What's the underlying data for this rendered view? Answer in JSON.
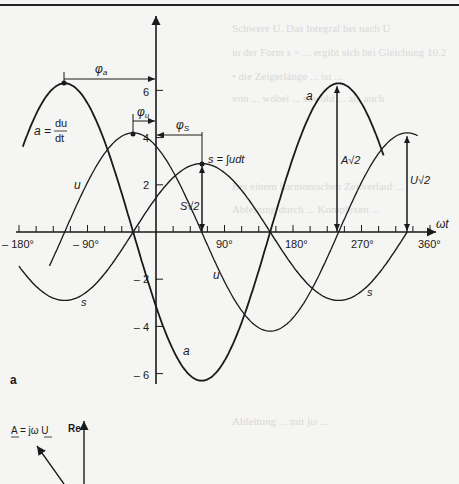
{
  "figure": {
    "panel_label": "a",
    "colors": {
      "ink": "#1a1a1a",
      "background": "#f5f5f3",
      "bleed_text": "#d9d9d6"
    }
  },
  "chart_data": {
    "type": "line",
    "title": "",
    "xlabel": "ωt",
    "ylabel": "",
    "x_ticks": [
      -180,
      -90,
      90,
      180,
      270,
      360
    ],
    "x_tick_labels": [
      "– 180°",
      "– 90°",
      "90°",
      "180°",
      "270°",
      "360°"
    ],
    "y_ticks": [
      6,
      4,
      2,
      -2,
      -4,
      -6
    ],
    "y_tick_labels": [
      "6",
      "4",
      "2",
      "– 2",
      "– 4",
      "– 6"
    ],
    "xlim": [
      -190,
      370
    ],
    "ylim": [
      -6.5,
      9
    ],
    "grid": false,
    "series": [
      {
        "name": "u",
        "amplitude": 4.2,
        "peak_at_deg": -30,
        "label": "u",
        "x_range": [
          -140,
          345
        ]
      },
      {
        "name": "a",
        "amplitude": 6.3,
        "peak_at_deg": -120,
        "label": "a",
        "x_range": [
          -175,
          300
        ]
      },
      {
        "name": "s",
        "amplitude": 2.9,
        "peak_at_deg": 60,
        "label": "s",
        "x_range": [
          -180,
          330
        ]
      }
    ],
    "annotations": {
      "a_def": "a = du/dt",
      "s_def": "s = ∫udt",
      "phi_a": "φa",
      "phi_u": "φu",
      "phi_s": "φS",
      "A_amp": "A√2",
      "U_amp": "U√2",
      "S_amp": "S√2"
    }
  },
  "phasor": {
    "equation": "A = jω U",
    "axis_label": "Re"
  },
  "labels": {
    "a_eq_lhs": "a =",
    "a_num": "du",
    "a_den": "dt",
    "s_def": "s = ∫udt",
    "u1": "u",
    "u2": "u",
    "a1": "a",
    "a2": "a",
    "s1": "s",
    "s2": "s",
    "phi_a": "φ",
    "phi_a_sub": "a",
    "phi_u": "φ",
    "phi_u_sub": "u",
    "phi_s": "φ",
    "phi_s_sub": "S",
    "A_amp": "A√2",
    "U_amp": "U√2",
    "S_amp": "S√2",
    "omega_t": "ωt",
    "panel": "a",
    "phasor_eq": "A = jω U",
    "phasor_re": "Re"
  },
  "bleed_through_text": [
    "Schwere U. Das Integral bei nach U",
    "in der Form s = ... ergibt sich bei Gleichung 10.2",
    "• die Zeigerlänge ... ist ...",
    "von ... wobei ... sowohl ... als auch",
    "Bei einem harmonischen Zeitverlauf ...",
    "Ableitung durch ... Komplexen ...",
    "Ableitung ... mit jω ..."
  ]
}
